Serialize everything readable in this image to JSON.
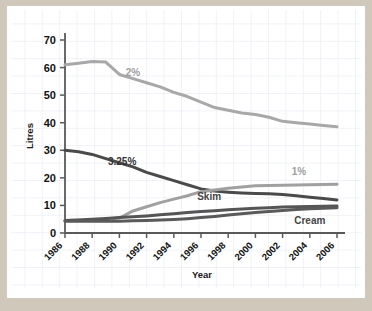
{
  "chart_data": {
    "type": "line",
    "title": "",
    "xlabel": "Year",
    "ylabel": "Litres",
    "xlim": [
      1986,
      2006
    ],
    "ylim": [
      0,
      70
    ],
    "grid": true,
    "legend_position": "inline-labels",
    "x": [
      1986,
      1987,
      1988,
      1989,
      1990,
      1991,
      1992,
      1993,
      1994,
      1995,
      1996,
      1997,
      1998,
      1999,
      2000,
      2001,
      2002,
      2003,
      2004,
      2005,
      2006
    ],
    "y_ticks": [
      0,
      10,
      20,
      30,
      40,
      50,
      60,
      70
    ],
    "x_ticks": [
      1986,
      1988,
      1990,
      1992,
      1994,
      1996,
      1998,
      2000,
      2002,
      2004,
      2006
    ],
    "series": [
      {
        "name": "2%",
        "label": "2%",
        "color": "#a8a8a8",
        "values": [
          61.0,
          61.6,
          62.2,
          62.0,
          57.5,
          56.0,
          54.5,
          53.0,
          51.0,
          49.5,
          47.5,
          45.5,
          44.5,
          43.5,
          43.0,
          42.0,
          40.5,
          40.0,
          39.5,
          39.0,
          38.5
        ]
      },
      {
        "name": "3.25%",
        "label": "3.25%",
        "color": "#4a4a4a",
        "values": [
          30.0,
          29.5,
          28.5,
          27.0,
          25.5,
          24.0,
          22.0,
          20.5,
          19.0,
          17.5,
          16.0,
          15.2,
          14.8,
          14.5,
          14.3,
          14.2,
          14.0,
          13.5,
          13.0,
          12.5,
          12.0
        ]
      },
      {
        "name": "1%",
        "label": "1%",
        "color": "#a0a0a0",
        "values": [
          4.5,
          4.6,
          4.8,
          5.0,
          5.4,
          8.0,
          9.5,
          11.0,
          12.3,
          13.5,
          15.0,
          15.6,
          16.2,
          16.7,
          17.1,
          17.2,
          17.3,
          17.4,
          17.5,
          17.6,
          17.7
        ]
      },
      {
        "name": "Skim",
        "label": "Skim",
        "color": "#555555",
        "values": [
          4.5,
          4.7,
          5.0,
          5.3,
          5.6,
          5.9,
          6.2,
          6.6,
          7.0,
          7.4,
          7.8,
          8.1,
          8.4,
          8.7,
          9.0,
          9.2,
          9.4,
          9.5,
          9.6,
          9.7,
          9.8
        ]
      },
      {
        "name": "Cream",
        "label": "Cream",
        "color": "#5a5a5a",
        "values": [
          4.3,
          4.3,
          4.3,
          4.3,
          4.3,
          4.4,
          4.5,
          4.7,
          4.9,
          5.2,
          5.6,
          6.0,
          6.5,
          7.0,
          7.4,
          7.8,
          8.2,
          8.5,
          8.8,
          9.0,
          9.2
        ]
      }
    ],
    "annotations": [
      {
        "text": "2%",
        "x": 1991.0,
        "y": 57.0,
        "color": "#a0a0a0"
      },
      {
        "text": "3.25%",
        "x": 1990.2,
        "y": 24.5,
        "color": "#333333"
      },
      {
        "text": "1%",
        "x": 2003.2,
        "y": 21.0,
        "color": "#a0a0a0"
      },
      {
        "text": "Skim",
        "x": 1996.6,
        "y": 11.8,
        "color": "#444444"
      },
      {
        "text": "Cream",
        "x": 2004.0,
        "y": 3.2,
        "color": "#444444"
      }
    ]
  },
  "colors": {
    "page_background": "#cfc8bb",
    "card_background": "#ffffff",
    "grid_line": "#d6dce8",
    "axis_line": "#5a5a5a",
    "text": "#111111"
  }
}
